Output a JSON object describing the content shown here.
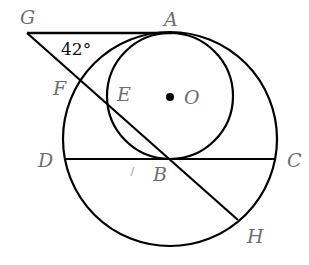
{
  "figure": {
    "type": "geometry",
    "angle_label": "42°",
    "points": {
      "G": "G",
      "A": "A",
      "F": "F",
      "E": "E",
      "O": "O",
      "D": "D",
      "B": "B",
      "C": "C",
      "H": "H"
    },
    "colors": {
      "stroke": "#000000",
      "label": "#6e6e6e"
    }
  }
}
